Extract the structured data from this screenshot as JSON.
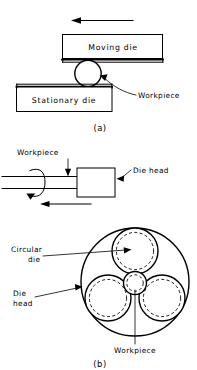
{
  "figure": {
    "title_a": "(a)",
    "title_b": "(b)",
    "panel_a": {
      "moving_die_label": "Moving die",
      "stationary_die_label": "Stationary die",
      "workpiece_label": "Workpiece",
      "motion_arrow_name": "left-arrow-icon"
    },
    "panel_b_side": {
      "workpiece_label": "Workpiece",
      "die_head_label": "Die head",
      "rotation_arrow_name": "rotation-arrow-icon",
      "feed_arrow_name": "left-arrow-icon"
    },
    "panel_b_front": {
      "circular_die_label_line1": "Circular",
      "circular_die_label_line2": "die",
      "die_head_label_line1": "Die",
      "die_head_label_line2": "head",
      "workpiece_label": "Workpiece"
    },
    "colors": {
      "stroke": "#000000",
      "background": "#ffffff"
    }
  }
}
